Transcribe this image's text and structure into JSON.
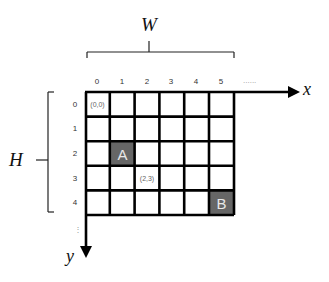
{
  "diagram": {
    "width_label": "W",
    "height_label": "H",
    "x_axis_label": "x",
    "y_axis_label": "y",
    "x_ellipsis": "......",
    "y_ellipsis": "⋮",
    "columns": [
      "0",
      "1",
      "2",
      "3",
      "4",
      "5"
    ],
    "rows": [
      "0",
      "1",
      "2",
      "3",
      "4"
    ],
    "coord_labels": {
      "origin": "(0,0)",
      "sample": "(2,3)"
    },
    "highlighted_cells": {
      "A": {
        "label": "A",
        "col": 1,
        "row": 2
      },
      "B": {
        "label": "B",
        "col": 5,
        "row": 4
      }
    },
    "colors": {
      "grid_line": "#000000",
      "highlight_fill": "#666666",
      "highlight_text": "#e8e8e8"
    }
  }
}
